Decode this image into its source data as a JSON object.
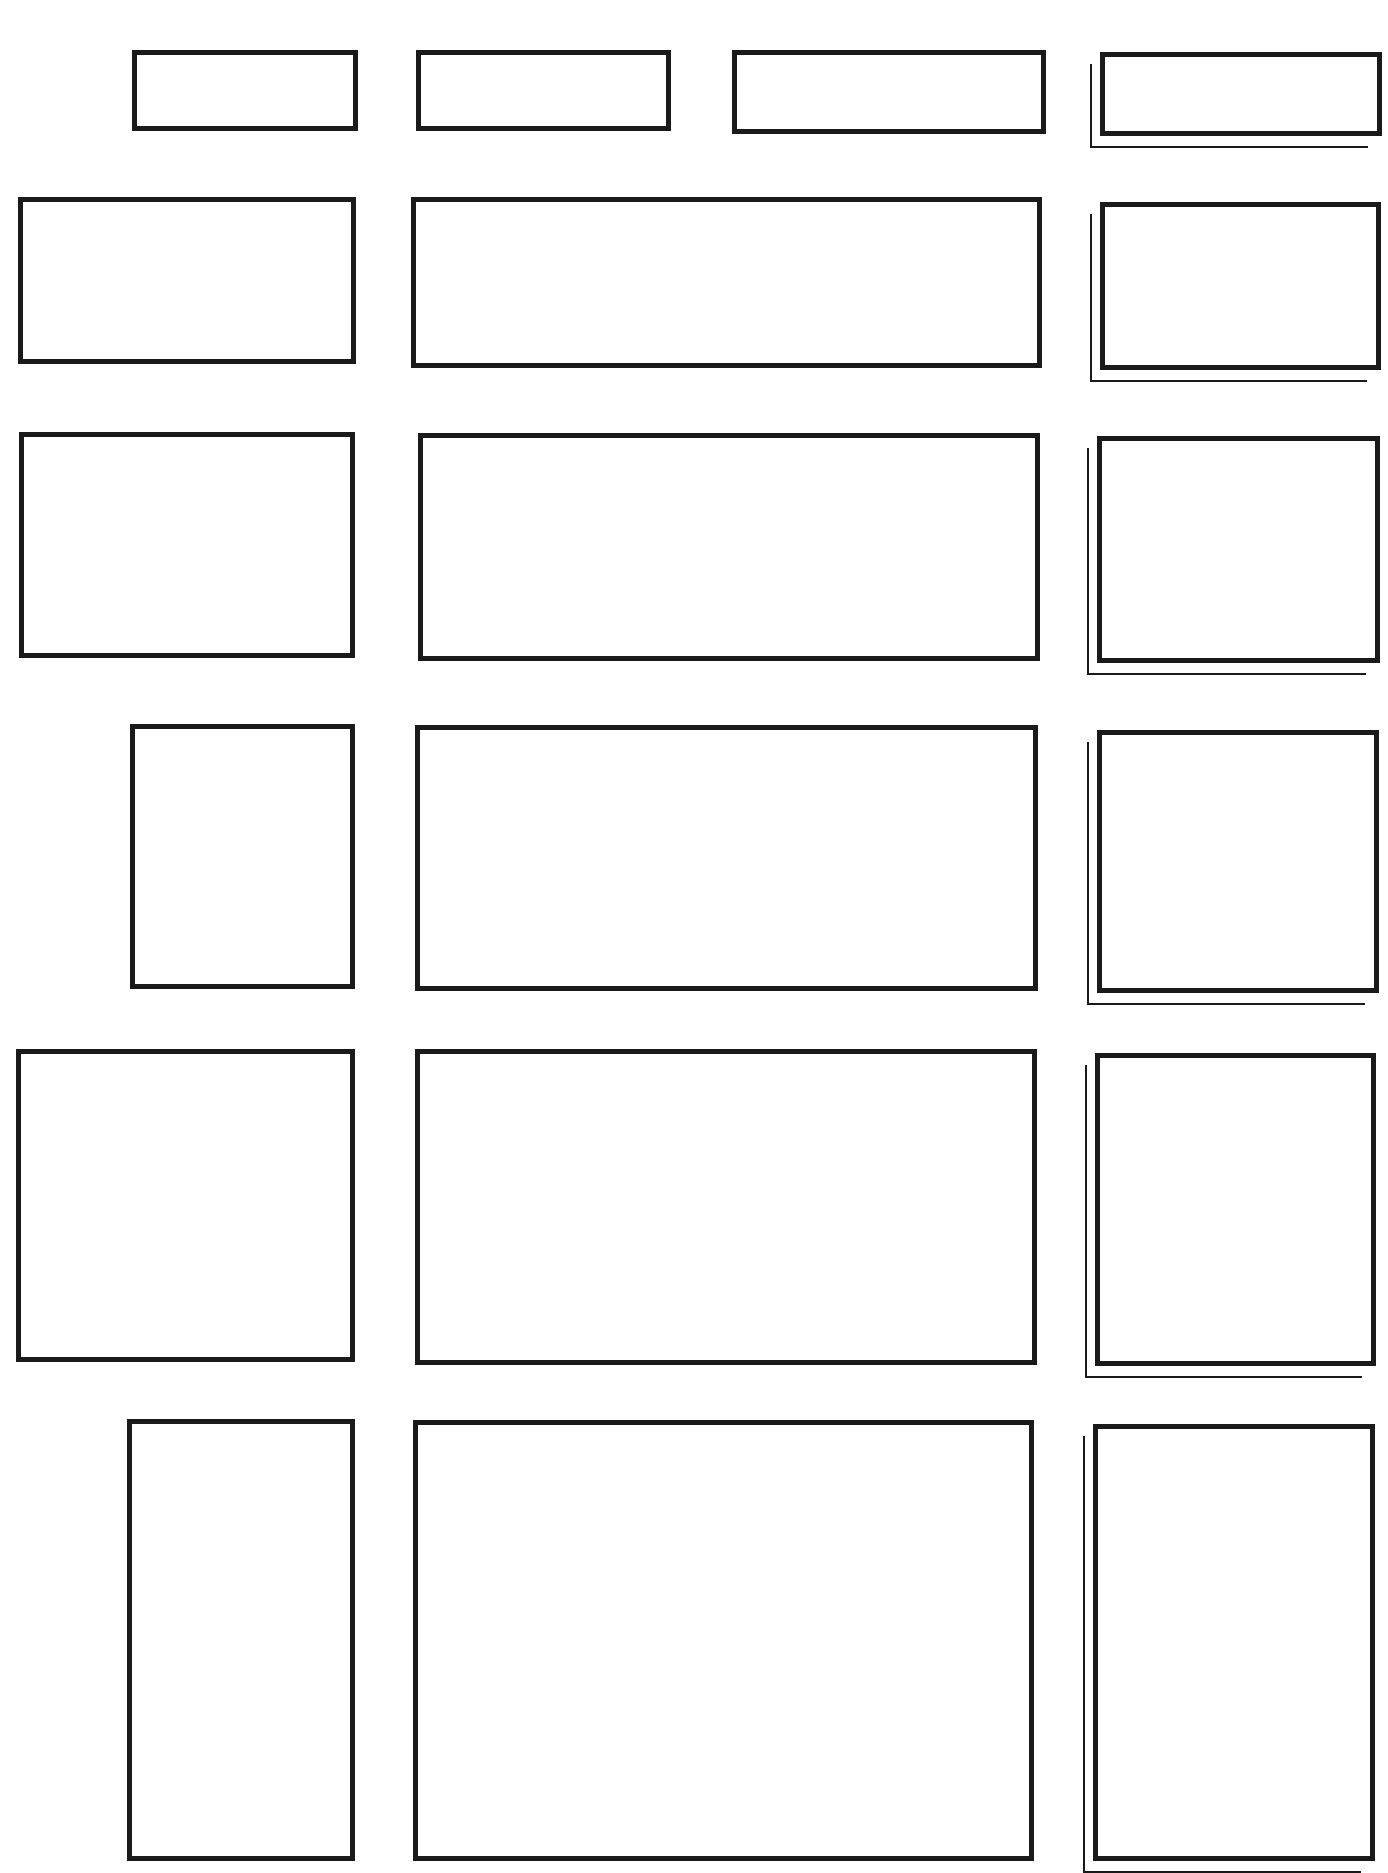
{
  "diagram": {
    "stroke_color": "#1a1a1a",
    "background": "#ffffff",
    "rows": [
      {
        "boxes": [
          {
            "x": 132,
            "y": 50,
            "w": 226,
            "h": 81
          },
          {
            "x": 416,
            "y": 50,
            "w": 255,
            "h": 81
          },
          {
            "x": 732,
            "y": 50,
            "w": 314,
            "h": 84
          },
          {
            "x": 1100,
            "y": 52,
            "w": 282,
            "h": 84,
            "shadow": true
          }
        ]
      },
      {
        "boxes": [
          {
            "x": 18,
            "y": 197,
            "w": 338,
            "h": 167
          },
          {
            "x": 411,
            "y": 197,
            "w": 631,
            "h": 171
          },
          {
            "x": 1100,
            "y": 202,
            "w": 281,
            "h": 168,
            "shadow": true
          }
        ]
      },
      {
        "boxes": [
          {
            "x": 19,
            "y": 432,
            "w": 336,
            "h": 226
          },
          {
            "x": 418,
            "y": 433,
            "w": 622,
            "h": 228
          },
          {
            "x": 1097,
            "y": 436,
            "w": 283,
            "h": 227,
            "shadow": true
          }
        ]
      },
      {
        "boxes": [
          {
            "x": 130,
            "y": 724,
            "w": 225,
            "h": 265
          },
          {
            "x": 415,
            "y": 725,
            "w": 623,
            "h": 266
          },
          {
            "x": 1097,
            "y": 730,
            "w": 282,
            "h": 263,
            "shadow": true
          }
        ]
      },
      {
        "boxes": [
          {
            "x": 16,
            "y": 1049,
            "w": 339,
            "h": 313
          },
          {
            "x": 415,
            "y": 1049,
            "w": 622,
            "h": 316
          },
          {
            "x": 1095,
            "y": 1053,
            "w": 281,
            "h": 313,
            "shadow": true
          }
        ]
      },
      {
        "boxes": [
          {
            "x": 127,
            "y": 1419,
            "w": 228,
            "h": 442
          },
          {
            "x": 413,
            "y": 1420,
            "w": 621,
            "h": 441
          },
          {
            "x": 1093,
            "y": 1424,
            "w": 282,
            "h": 437,
            "shadow": true
          }
        ]
      }
    ]
  }
}
